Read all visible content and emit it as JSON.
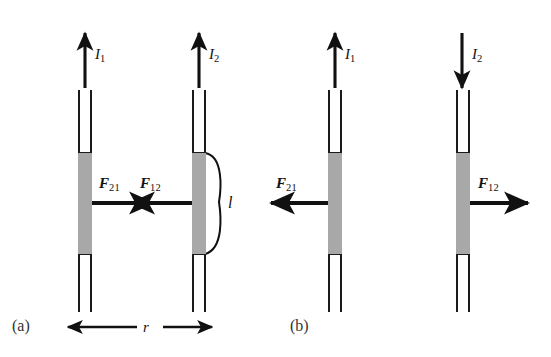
{
  "figure": {
    "kind": "physics-diagram",
    "background_color": "#ffffff",
    "line_color": "#1a1a1a",
    "segment_fill": "#a8a8a8"
  },
  "panels": [
    {
      "id": "a",
      "label": "(a)",
      "case": "parallel currents - attraction",
      "wires": [
        {
          "id": "wire-1",
          "current_label": "I",
          "current_sub": "1",
          "current_direction": "up",
          "force_label": "F",
          "force_sub": "21",
          "force_direction": "right"
        },
        {
          "id": "wire-2",
          "current_label": "I",
          "current_sub": "2",
          "current_direction": "up",
          "force_label": "F",
          "force_sub": "12",
          "force_direction": "left"
        }
      ],
      "length_label": "l",
      "separation_label": "r",
      "separation_arrow": "double-headed"
    },
    {
      "id": "b",
      "label": "(b)",
      "case": "antiparallel currents - repulsion",
      "wires": [
        {
          "id": "wire-1",
          "current_label": "I",
          "current_sub": "1",
          "current_direction": "up",
          "force_label": "F",
          "force_sub": "21",
          "force_direction": "left"
        },
        {
          "id": "wire-2",
          "current_label": "I",
          "current_sub": "2",
          "current_direction": "down",
          "force_label": "F",
          "force_sub": "12",
          "force_direction": "right"
        }
      ],
      "length_label": "",
      "separation_label": "",
      "separation_arrow": "none"
    }
  ]
}
